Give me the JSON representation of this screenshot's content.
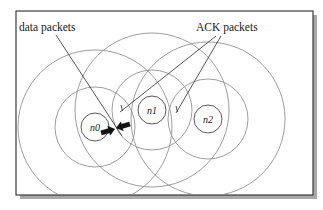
{
  "figure": {
    "background_color": "#ffffff",
    "frame": {
      "x": 16,
      "y": 11,
      "width": 297,
      "height": 184,
      "stroke_color": "#2b2b2b",
      "shadow_color": "#9a9a9a"
    },
    "colors": {
      "range_circle": "#8d8d8d",
      "node_circle_stroke": "#4a4a4a",
      "node_fill": "#ffffff",
      "leader_line": "#3a3a3a",
      "packet_fill": "#111111",
      "text": "#1a1a1a"
    }
  },
  "callouts": [
    {
      "id": "data-packets",
      "label": "data packets",
      "text_x": 19,
      "text_y": 31,
      "line": {
        "x1": 56,
        "y1": 35,
        "x2": 122,
        "y2": 136
      }
    },
    {
      "id": "ack-packets",
      "label": "ACK packets",
      "text_x": 196,
      "text_y": 31,
      "lines": [
        {
          "x1": 216,
          "y1": 36,
          "x2": 120,
          "y2": 112
        },
        {
          "x1": 221,
          "y1": 36,
          "x2": 176,
          "y2": 113
        }
      ]
    }
  ],
  "nodes": [
    {
      "id": "n0",
      "label": "n0",
      "cx": 95,
      "cy": 127,
      "node_radius": 14,
      "range_radii": [
        40,
        77
      ]
    },
    {
      "id": "n1",
      "label": "n1",
      "cx": 152,
      "cy": 110,
      "node_radius": 14,
      "range_radii": [
        40,
        77
      ]
    },
    {
      "id": "n2",
      "label": "n2",
      "cx": 208,
      "cy": 119,
      "node_radius": 14,
      "range_radii": [
        40,
        77
      ]
    }
  ],
  "packets": [
    {
      "id": "data-packet-1",
      "type": "data",
      "direction": "left",
      "x": 108,
      "y": 131,
      "rotation": -16
    },
    {
      "id": "data-packet-2",
      "type": "data",
      "direction": "left",
      "x": 123,
      "y": 126,
      "rotation": -16
    }
  ],
  "tick_marks": [
    {
      "id": "ack-tick-n1",
      "x": 121,
      "y": 108,
      "length": 6,
      "rotation": -8
    },
    {
      "id": "ack-tick-n2",
      "x": 176,
      "y": 109,
      "length": 6,
      "rotation": -8
    }
  ]
}
